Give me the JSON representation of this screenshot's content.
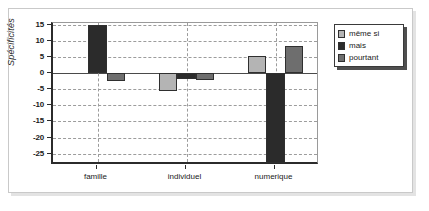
{
  "chart_data": {
    "type": "bar",
    "title": "",
    "subtitle": "",
    "xlabel": "",
    "ylabel": "Spécificités",
    "categories": [
      "famille",
      "individuel",
      "numerique"
    ],
    "series": [
      {
        "name": "même si",
        "color": "#b4b4b4",
        "values": [
          0,
          -5.5,
          5.3
        ]
      },
      {
        "name": "mais",
        "color": "#2b2b2b",
        "values": [
          15,
          -2.0,
          -28
        ]
      },
      {
        "name": "pourtant",
        "color": "#6e6e6e",
        "values": [
          -2.5,
          -2.3,
          8.3
        ]
      }
    ],
    "ylim": [
      -28.5,
      15.5
    ],
    "yticks": [
      15,
      10,
      5,
      0,
      -5,
      -10,
      -15,
      -20,
      -25
    ],
    "ytick_labels": [
      "15",
      "10",
      "5",
      "0",
      "-5",
      "-10",
      "-15",
      "-20",
      "-25"
    ],
    "grid": true,
    "grid_style": "dashed",
    "legend_position": "top-right",
    "zero_line": true,
    "colors": {
      "axis": "#2b2b2b",
      "grid": "#9c9c9c",
      "frame": "#c9c9c9",
      "background": "#ffffff",
      "bar_edge": "#2f2f2f"
    }
  }
}
